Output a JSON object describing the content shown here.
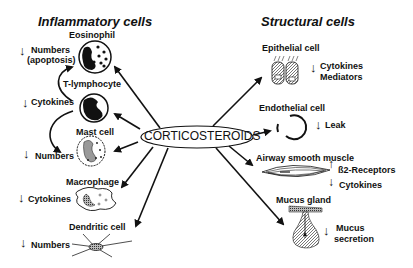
{
  "diagram": {
    "center": "CORTICOSTEROIDS",
    "left_heading": "Inflammatory cells",
    "right_heading": "Structural cells",
    "inflammatory_cells": [
      {
        "name": "Eosinophil",
        "effect_arrow": "↓",
        "effect": [
          "Numbers",
          "(apoptosis)"
        ]
      },
      {
        "name": "T-lymphocyte",
        "effect_arrow": "↓",
        "effect": [
          "Cytokines"
        ]
      },
      {
        "name": "Mast cell",
        "effect_arrow": "↓",
        "effect": [
          "Numbers"
        ]
      },
      {
        "name": "Macrophage",
        "effect_arrow": "↓",
        "effect": [
          "Cytokines"
        ]
      },
      {
        "name": "Dendritic cell",
        "effect_arrow": "↓",
        "effect": [
          "Numbers"
        ]
      }
    ],
    "structural_cells": [
      {
        "name": "Epithelial cell",
        "effect_arrow": "↓",
        "effect": [
          "Cytokines",
          "Mediators"
        ]
      },
      {
        "name": "Endothelial cell",
        "effect_arrow": "↓",
        "effect": [
          "Leak"
        ]
      },
      {
        "name": "Airway smooth muscle",
        "effect_arrows": [
          "↑",
          "↓"
        ],
        "effect": [
          "ß2-Receptors",
          "Cytokines"
        ]
      },
      {
        "name": "Mucus gland",
        "effect_arrow": "↓",
        "effect": [
          "Mucus",
          "secretion"
        ]
      }
    ]
  }
}
